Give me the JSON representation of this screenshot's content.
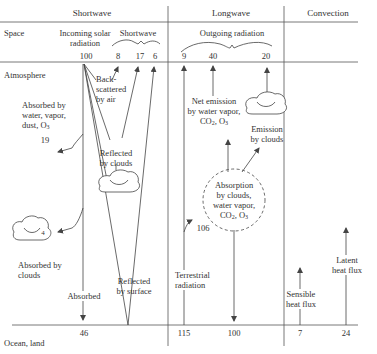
{
  "sections": {
    "shortwave": "Shortwave",
    "longwave": "Longwave",
    "convection": "Convection"
  },
  "rows": {
    "space": "Space",
    "atmosphere": "Atmosphere",
    "surface": "Ocean, land"
  },
  "shortwave": {
    "incoming_label_1": "Incoming solar",
    "incoming_label_2": "radiation",
    "outgoing_label": "Shortwave",
    "incoming_value": "100",
    "out_backscatter": "8",
    "out_clouds": "17",
    "out_surface": "6",
    "backscatter_1": "Back-",
    "backscatter_2": "scattered",
    "backscatter_3": "by air",
    "absorbed_wv_1": "Absorbed by",
    "absorbed_wv_2": "water, vapor,",
    "absorbed_wv_3": "dust, O",
    "absorbed_wv_sub": "3",
    "absorbed_wv_value": "19",
    "reflected_clouds_1": "Reflected",
    "reflected_clouds_2": "by clouds",
    "absorbed_clouds_value": "4",
    "absorbed_clouds_1": "Absorbed by",
    "absorbed_clouds_2": "clouds",
    "reflected_surface_1": "Reflected",
    "reflected_surface_2": "by surface",
    "absorbed_label": "Absorbed",
    "absorbed_surface_value": "46"
  },
  "longwave": {
    "outgoing_label": "Outgoing radiation",
    "out_surface": "9",
    "out_gas": "40",
    "out_clouds": "20",
    "net_emission_1": "Net emission",
    "net_emission_2": "by water vapor,",
    "net_emission_3a": "CO",
    "net_emission_3b": "2",
    "net_emission_3c": ", O",
    "net_emission_3d": "3",
    "emission_clouds_1": "Emission",
    "emission_clouds_2": "by clouds",
    "absorption_1": "Absorption",
    "absorption_2": "by clouds,",
    "absorption_3": "water vapor,",
    "absorption_4a": "CO",
    "absorption_4b": "2",
    "absorption_4c": ", O",
    "absorption_4d": "3",
    "absorbed_terrestrial_value": "106",
    "terrestrial_1": "Terrestrial",
    "terrestrial_2": "radiation",
    "surface_emitted_value": "115",
    "back_radiation_value": "100"
  },
  "convection": {
    "sensible_1": "Sensible",
    "sensible_2": "heat flux",
    "sensible_value": "7",
    "latent_1": "Latent",
    "latent_2": "heat flux",
    "latent_value": "24"
  },
  "colors": {
    "line": "#444444",
    "text": "#333333",
    "background": "#ffffff"
  }
}
